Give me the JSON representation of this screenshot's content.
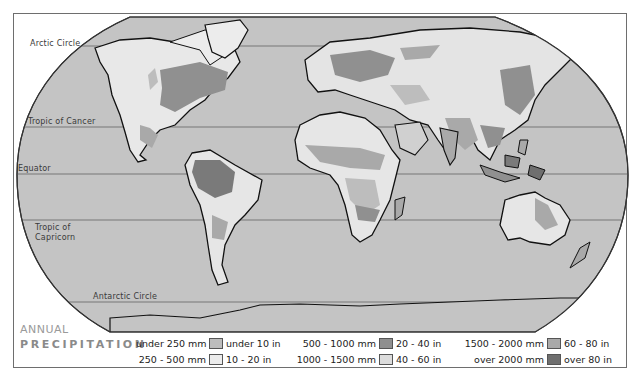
{
  "map": {
    "title_line1": "ANNUAL",
    "title_line2": "PRECIPITATION",
    "ocean_color": "#c4c4c4",
    "latitude_lines": [
      {
        "label": "Arctic Circle",
        "y": 46
      },
      {
        "label": "Tropic of Cancer",
        "y": 127
      },
      {
        "label": "Equator",
        "y": 174
      },
      {
        "label": "Tropic of",
        "label2": "Capricorn",
        "y": 220
      },
      {
        "label": "Antarctic Circle",
        "y": 302
      }
    ]
  },
  "legend": {
    "items": [
      {
        "mm": "under 250 mm",
        "in": "under 10 in",
        "color": "#bdbdbd"
      },
      {
        "mm": "250 - 500 mm",
        "in": "10 - 20 in",
        "color": "#ececec"
      },
      {
        "mm": "500 - 1000 mm",
        "in": "20 - 40 in",
        "color": "#8f8f8f"
      },
      {
        "mm": "1000 - 1500 mm",
        "in": "40 - 60 in",
        "color": "#dcdcdc"
      },
      {
        "mm": "1500 - 2000 mm",
        "in": "60 - 80 in",
        "color": "#a9a9a9"
      },
      {
        "mm": "over 2000 mm",
        "in": "over 80 in",
        "color": "#6f6f6f"
      }
    ]
  }
}
